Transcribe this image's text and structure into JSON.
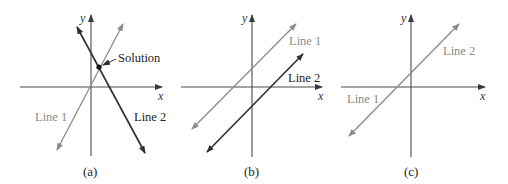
{
  "colors": {
    "axis": "#4a4a4a",
    "line_light": "#8c8c8c",
    "line_dark": "#2e2e2e",
    "text_dark": "#222222",
    "text_light": "#8c8c8c"
  },
  "axis_labels": {
    "x": "x",
    "y": "y"
  },
  "panels": [
    {
      "caption": "(a)",
      "lines": [
        {
          "label": "Line 1",
          "shade": "light"
        },
        {
          "label": "Line 2",
          "shade": "dark"
        }
      ],
      "annotation": "Solution",
      "description": "Two lines intersecting at one point (one solution)"
    },
    {
      "caption": "(b)",
      "lines": [
        {
          "label": "Line 1",
          "shade": "light"
        },
        {
          "label": "Line 2",
          "shade": "dark"
        }
      ],
      "description": "Two parallel lines (no solution)"
    },
    {
      "caption": "(c)",
      "lines": [
        {
          "label": "Line 1",
          "shade": "light"
        },
        {
          "label": "Line 2",
          "shade": "light"
        }
      ],
      "description": "Two coincident lines (infinitely many solutions)"
    }
  ]
}
